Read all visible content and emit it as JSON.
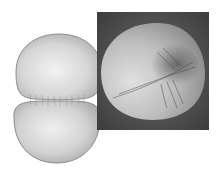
{
  "figure": {
    "illustration": {
      "subject": "dividing-cell-cleavage-furrow",
      "fill": "#d4d4d4",
      "outline": "#7a7a7a"
    },
    "micrograph": {
      "subject": "cell-cleavage-furrow-electron-micrograph",
      "background": "#4a4a4a",
      "cell_fill": "#c8c8c8"
    }
  }
}
